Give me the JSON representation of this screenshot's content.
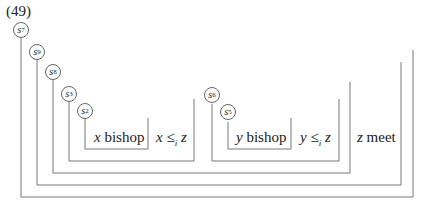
{
  "example_number": "(49)",
  "nodes": [
    {
      "id": "s7",
      "label": "s",
      "sub": "7"
    },
    {
      "id": "s9",
      "label": "s",
      "sub": "9"
    },
    {
      "id": "s8",
      "label": "s",
      "sub": "8"
    },
    {
      "id": "s3",
      "label": "s",
      "sub": "3"
    },
    {
      "id": "s2",
      "label": "s",
      "sub": "2"
    },
    {
      "id": "s6",
      "label": "s",
      "sub": "6"
    },
    {
      "id": "s5",
      "label": "s",
      "sub": "5"
    }
  ],
  "boxes": {
    "x_bishop": {
      "var": "x",
      "word": "bishop"
    },
    "x_leq": {
      "a": "x",
      "op": "≤",
      "sub": "i",
      "b": "z"
    },
    "y_bishop": {
      "var": "y",
      "word": "bishop"
    },
    "y_leq": {
      "a": "y",
      "op": "≤",
      "sub": "i",
      "b": "z"
    },
    "z_meet": {
      "var": "z",
      "word": "meet"
    }
  },
  "colors": {
    "line": "#777777",
    "text": "#222222"
  }
}
